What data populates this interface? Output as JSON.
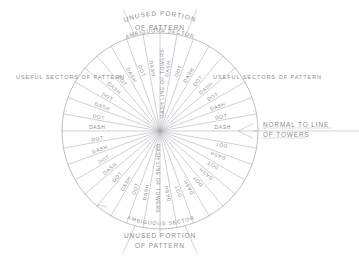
{
  "figure": {
    "type": "radial-pattern-diagram",
    "center": {
      "x": 160,
      "y": 131
    },
    "radius": 98,
    "background_color": "#ffffff",
    "line_color": "#a9a9b0",
    "text_color": "#8d8d93"
  },
  "annotations": {
    "unused_top_line1": "UNUSED PORTION",
    "unused_top_line2": "OF PATTERN",
    "unused_bottom_line1": "UNUSED PORTION",
    "unused_bottom_line2": "OF PATTERN",
    "ambiguous_top": "AMBIGUOUS SECTOR",
    "ambiguous_bottom": "AMBIGUOUS SECTOR",
    "useful_left": "USEFUL SECTORS OF PATTERN",
    "useful_right": "USEFUL SECTORS OF PATTERN",
    "normal_line1": "NORMAL TO LINE",
    "normal_line2": "OF TOWERS",
    "centerline_top": "DASH LINE OF TOWERS",
    "centerline_bottom": "DASH LINE OF TOWERS"
  },
  "chart_data": {
    "type": "radial",
    "center_label_top": "DASH LINE OF TOWERS",
    "center_label_bottom": "DASH LINE OF TOWERS",
    "sector_names": [
      "UNUSED PORTION OF PATTERN",
      "AMBIGUOUS SECTOR",
      "USEFUL SECTORS OF PATTERN"
    ],
    "reference_direction": "NORMAL TO LINE OF TOWERS",
    "spokes": [
      {
        "angle_deg": 0,
        "label": "DASH"
      },
      {
        "angle_deg": 10,
        "label": "DOT"
      },
      {
        "angle_deg": 20,
        "label": "DASH"
      },
      {
        "angle_deg": 30,
        "label": "DOT"
      },
      {
        "angle_deg": 40,
        "label": "DASH"
      },
      {
        "angle_deg": 50,
        "label": "DOT"
      },
      {
        "angle_deg": 60,
        "label": "DASH"
      },
      {
        "angle_deg": 70,
        "label": "DOT"
      },
      {
        "angle_deg": 80,
        "label": "DASH"
      },
      {
        "angle_deg": 100,
        "label": "DASH"
      },
      {
        "angle_deg": 110,
        "label": "DOT"
      },
      {
        "angle_deg": 120,
        "label": "DASH"
      },
      {
        "angle_deg": 130,
        "label": "DOT"
      },
      {
        "angle_deg": 140,
        "label": "DASH"
      },
      {
        "angle_deg": 150,
        "label": "DOT"
      },
      {
        "angle_deg": 160,
        "label": "DASH"
      },
      {
        "angle_deg": 170,
        "label": "DOT"
      },
      {
        "angle_deg": 180,
        "label": "DASH"
      },
      {
        "angle_deg": 190,
        "label": "DOT"
      },
      {
        "angle_deg": 200,
        "label": "DASH"
      },
      {
        "angle_deg": 210,
        "label": "DOT"
      },
      {
        "angle_deg": 220,
        "label": "DASH"
      },
      {
        "angle_deg": 230,
        "label": "DOT"
      },
      {
        "angle_deg": 240,
        "label": "DASH"
      },
      {
        "angle_deg": 250,
        "label": "DOT"
      },
      {
        "angle_deg": 260,
        "label": "DASH"
      },
      {
        "angle_deg": 280,
        "label": "DASH"
      },
      {
        "angle_deg": 290,
        "label": "DOT"
      },
      {
        "angle_deg": 300,
        "label": "DASH"
      },
      {
        "angle_deg": 310,
        "label": "DOT"
      },
      {
        "angle_deg": 320,
        "label": "DASH"
      },
      {
        "angle_deg": 330,
        "label": "DOT"
      },
      {
        "angle_deg": 340,
        "label": "DASH"
      },
      {
        "angle_deg": 350,
        "label": "DOT"
      }
    ],
    "sector_boundaries_deg": [
      75,
      105,
      255,
      285
    ]
  }
}
